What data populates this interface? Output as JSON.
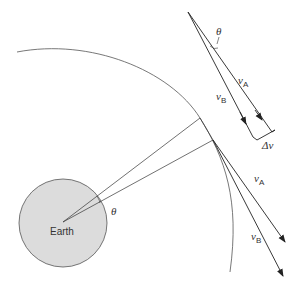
{
  "diagram": {
    "earth": {
      "label": "Earth",
      "fill": "#dcdcdc",
      "stroke": "#555555"
    },
    "angle_label_center": "θ",
    "angle_label_vectors": "θ",
    "vectors": {
      "vA": {
        "symbol": "v",
        "subscript": "A"
      },
      "vB": {
        "symbol": "v",
        "subscript": "B"
      },
      "delta_v": "Δv"
    },
    "colors": {
      "line": "#333333",
      "orbit": "#555555",
      "background": "#ffffff"
    }
  }
}
